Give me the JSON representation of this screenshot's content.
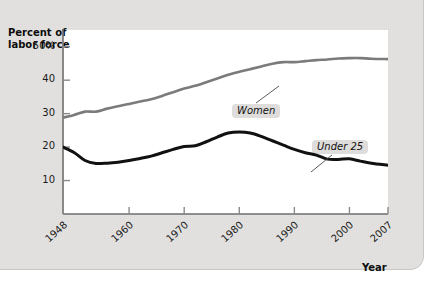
{
  "figure": {
    "background_color": "#e4e3e1",
    "plot_background_color": "#ffffff"
  },
  "axes": {
    "y_title_line1": "Percent of",
    "y_title_line2": "labor force",
    "x_title": "Year",
    "y_ticks": [
      "50%",
      "40",
      "30",
      "20",
      "10"
    ],
    "x_ticks": [
      "1948",
      "1960",
      "1970",
      "1980",
      "1990",
      "2000",
      "2007"
    ]
  },
  "labels": {
    "women": "Women",
    "under25": "Under 25"
  },
  "chart_data": {
    "type": "line",
    "title": "",
    "xlabel": "Year",
    "ylabel": "Percent of labor force",
    "xlim": [
      1948,
      2007
    ],
    "ylim": [
      0,
      55
    ],
    "yticks": [
      10,
      20,
      30,
      40,
      50
    ],
    "ytick_labels": [
      "10",
      "20",
      "30",
      "40",
      "50%"
    ],
    "xticks": [
      1948,
      1960,
      1970,
      1980,
      1990,
      2000,
      2007
    ],
    "grid": false,
    "legend": "inline-annotations",
    "annotations": [
      {
        "text": "Women",
        "series": "Women",
        "x": 1982,
        "y": 40.0
      },
      {
        "text": "Under 25",
        "series": "Under 25",
        "x": 1996,
        "y": 24.5
      }
    ],
    "series": [
      {
        "name": "Women",
        "color": "#7b7b7b",
        "line_width": 2.6,
        "x": [
          1948,
          1950,
          1952,
          1954,
          1956,
          1958,
          1960,
          1962,
          1964,
          1966,
          1968,
          1970,
          1972,
          1974,
          1976,
          1978,
          1980,
          1982,
          1984,
          1986,
          1988,
          1990,
          1992,
          1994,
          1996,
          1998,
          2000,
          2002,
          2004,
          2007
        ],
        "values": [
          28.8,
          29.6,
          30.6,
          30.6,
          31.5,
          32.2,
          32.9,
          33.6,
          34.3,
          35.3,
          36.4,
          37.5,
          38.3,
          39.4,
          40.5,
          41.6,
          42.5,
          43.3,
          44.1,
          44.9,
          45.4,
          45.4,
          45.7,
          46.0,
          46.2,
          46.5,
          46.6,
          46.6,
          46.4,
          46.3
        ]
      },
      {
        "name": "Under 25",
        "color": "#111111",
        "line_width": 3.0,
        "x": [
          1948,
          1950,
          1952,
          1954,
          1956,
          1958,
          1960,
          1962,
          1964,
          1966,
          1968,
          1970,
          1972,
          1974,
          1976,
          1978,
          1980,
          1982,
          1984,
          1986,
          1988,
          1990,
          1992,
          1994,
          1996,
          1998,
          2000,
          2002,
          2004,
          2007
        ],
        "values": [
          20.0,
          18.4,
          16.0,
          15.1,
          15.2,
          15.5,
          16.0,
          16.6,
          17.3,
          18.3,
          19.3,
          20.2,
          20.4,
          21.6,
          23.0,
          24.2,
          24.5,
          24.2,
          23.2,
          21.9,
          20.6,
          19.3,
          18.3,
          17.6,
          16.4,
          16.3,
          16.5,
          15.8,
          15.2,
          14.6
        ]
      }
    ]
  }
}
